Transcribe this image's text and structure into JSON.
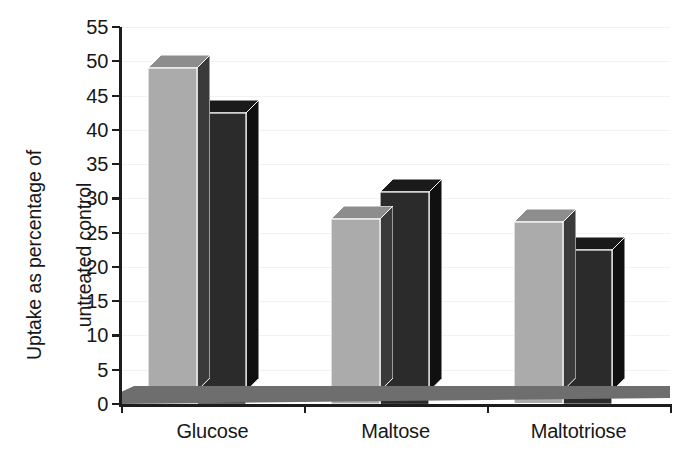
{
  "chart_data": {
    "type": "bar",
    "title": "",
    "subtitle": "",
    "xlabel": "",
    "ylabel": "Uptake as percentage of\nuntreated control",
    "categories": [
      "Glucose",
      "Maltose",
      "Maltotriose"
    ],
    "series": [
      {
        "name": "series-1-light-gray",
        "color": "#ababab",
        "values": [
          49,
          27,
          26.5
        ]
      },
      {
        "name": "series-2-dark",
        "color": "#2b2b2b",
        "values": [
          42.5,
          31,
          22.5
        ]
      }
    ],
    "ylim": [
      0,
      55
    ],
    "ytick_labels": [
      "0",
      "5",
      "10",
      "15",
      "20",
      "25",
      "30",
      "35",
      "40",
      "45",
      "50",
      "55"
    ],
    "ytick_values": [
      0,
      5,
      10,
      15,
      20,
      25,
      30,
      35,
      40,
      45,
      50,
      55
    ],
    "grid": true,
    "grid_axis": "y",
    "legend": false,
    "legend_position": "none",
    "style": "3d-column",
    "annotations": []
  },
  "axes": {
    "y_title_line1": "Uptake as percentage of",
    "y_title_line2": "untreated control",
    "y_title": "Uptake as percentage of\nuntreated control"
  },
  "colors": {
    "bar_light_front": "#ababab",
    "bar_light_top": "#8d8d8d",
    "bar_light_side": "#3a3a3a",
    "bar_dark_front": "#2b2b2b",
    "bar_dark_top": "#1a1a1a",
    "bar_dark_side": "#101010",
    "floor": "#6e6e6e",
    "axis": "#1d1d1d",
    "gridline": "#f2f2f2",
    "text": "#171717",
    "background": "#ffffff"
  }
}
